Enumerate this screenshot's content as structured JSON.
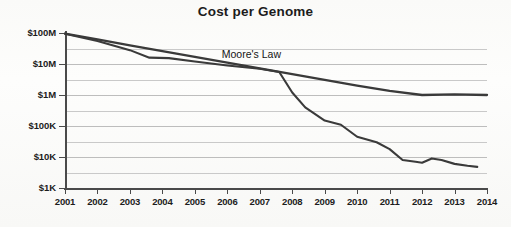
{
  "chart_data": {
    "type": "line",
    "title": "Cost per Genome",
    "xlabel": "",
    "ylabel": "",
    "x_tick_labels": [
      "2001",
      "2002",
      "2003",
      "2004",
      "2005",
      "2006",
      "2007",
      "2008",
      "2009",
      "2010",
      "2011",
      "2012",
      "2013",
      "2014"
    ],
    "x_values": [
      2001,
      2002,
      2003,
      2004,
      2005,
      2006,
      2007,
      2008,
      2009,
      2010,
      2011,
      2012,
      2013,
      2014
    ],
    "xlim": [
      2001,
      2014
    ],
    "y_tick_labels": [
      "$100M",
      "$10M",
      "$1M",
      "$100K",
      "$10K",
      "$1K"
    ],
    "y_tick_values": [
      100000000,
      10000000,
      1000000,
      100000,
      10000,
      1000
    ],
    "y_scale": "log",
    "ylim": [
      1000,
      100000000
    ],
    "grid": "horizontal-minor-and-major",
    "legend": "none",
    "annotations": [
      {
        "text": "Moore's Law",
        "x": 2007.0,
        "y": 18000000
      }
    ],
    "series": [
      {
        "name": "Moore's Law",
        "color": "#3a3a3a",
        "points": [
          {
            "x": 2001,
            "y": 95000000
          },
          {
            "x": 2002,
            "y": 62000000
          },
          {
            "x": 2003,
            "y": 40000000
          },
          {
            "x": 2004,
            "y": 26000000
          },
          {
            "x": 2005,
            "y": 17000000
          },
          {
            "x": 2006,
            "y": 11000000
          },
          {
            "x": 2007,
            "y": 7200000
          },
          {
            "x": 2008,
            "y": 4700000
          },
          {
            "x": 2009,
            "y": 3100000
          },
          {
            "x": 2010,
            "y": 2000000
          },
          {
            "x": 2011,
            "y": 1350000
          },
          {
            "x": 2012,
            "y": 1000000
          },
          {
            "x": 2013,
            "y": 1050000
          },
          {
            "x": 2014,
            "y": 1000000
          }
        ]
      },
      {
        "name": "Cost per Genome",
        "color": "#3a3a3a",
        "points": [
          {
            "x": 2001.0,
            "y": 95000000
          },
          {
            "x": 2002.0,
            "y": 55000000
          },
          {
            "x": 2003.0,
            "y": 28000000
          },
          {
            "x": 2003.6,
            "y": 16000000
          },
          {
            "x": 2004.2,
            "y": 15500000
          },
          {
            "x": 2005.0,
            "y": 12000000
          },
          {
            "x": 2006.0,
            "y": 9000000
          },
          {
            "x": 2007.0,
            "y": 7000000
          },
          {
            "x": 2007.6,
            "y": 5500000
          },
          {
            "x": 2008.0,
            "y": 1200000
          },
          {
            "x": 2008.4,
            "y": 400000
          },
          {
            "x": 2009.0,
            "y": 150000
          },
          {
            "x": 2009.5,
            "y": 110000
          },
          {
            "x": 2010.0,
            "y": 45000
          },
          {
            "x": 2010.6,
            "y": 30000
          },
          {
            "x": 2011.0,
            "y": 18000
          },
          {
            "x": 2011.4,
            "y": 8000
          },
          {
            "x": 2011.8,
            "y": 7000
          },
          {
            "x": 2012.0,
            "y": 6500
          },
          {
            "x": 2012.3,
            "y": 9000
          },
          {
            "x": 2012.6,
            "y": 8000
          },
          {
            "x": 2013.0,
            "y": 6000
          },
          {
            "x": 2013.4,
            "y": 5200
          },
          {
            "x": 2013.7,
            "y": 4800
          }
        ]
      }
    ]
  }
}
